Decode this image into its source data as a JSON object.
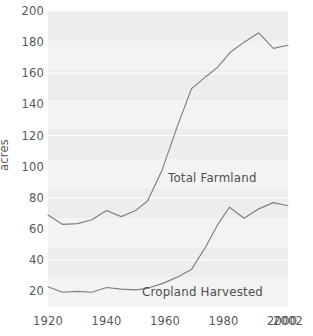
{
  "chart_data": {
    "type": "line",
    "title": "",
    "xlabel": "",
    "ylabel": "acres",
    "xlim": [
      1920,
      2002
    ],
    "ylim": [
      10,
      200
    ],
    "grid": true,
    "legend_position": "inline-annotation",
    "y_ticks": [
      200,
      180,
      160,
      140,
      120,
      100,
      80,
      60,
      40,
      20
    ],
    "x_ticks": [
      1920,
      1940,
      1960,
      1980,
      2000,
      2002
    ],
    "series": [
      {
        "name": "Total Farmland",
        "color": "#7f7f82",
        "x": [
          1920,
          1925,
          1930,
          1935,
          1940,
          1945,
          1950,
          1954,
          1959,
          1964,
          1969,
          1974,
          1978,
          1982,
          1987,
          1992,
          1997,
          2002
        ],
        "values": [
          69,
          63,
          63.5,
          66,
          72,
          68,
          72,
          78,
          98,
          125,
          150,
          158,
          164,
          173,
          180,
          186,
          176,
          178
        ]
      },
      {
        "name": "Cropland Harvested",
        "color": "#7f7f82",
        "x": [
          1920,
          1925,
          1930,
          1935,
          1940,
          1945,
          1950,
          1954,
          1959,
          1964,
          1969,
          1974,
          1978,
          1982,
          1987,
          1992,
          1997,
          2002
        ],
        "values": [
          23,
          19.5,
          20,
          19.5,
          22.5,
          21.5,
          21,
          22,
          25,
          29,
          34,
          49,
          63,
          74,
          67,
          73,
          77,
          75
        ]
      }
    ],
    "annotations": [
      {
        "text": "Total Farmland",
        "series": "Total Farmland"
      },
      {
        "text": "Cropland Harvested",
        "series": "Cropland Harvested"
      }
    ],
    "colors": {
      "plot_background": "#ededee",
      "gridline": "#ffffff",
      "line": "#7f7f82",
      "text": "#58585a",
      "page_background": "#ffffff"
    }
  },
  "axis": {
    "y_title": "acres",
    "y_labels": [
      "200",
      "180",
      "160",
      "140",
      "120",
      "100",
      "80",
      "60",
      "40",
      "20"
    ],
    "x_labels": [
      "1920",
      "1940",
      "1960",
      "1980",
      "2000",
      "2002"
    ]
  },
  "labels": {
    "total_farmland": "Total Farmland",
    "cropland_harvested": "Cropland Harvested"
  }
}
